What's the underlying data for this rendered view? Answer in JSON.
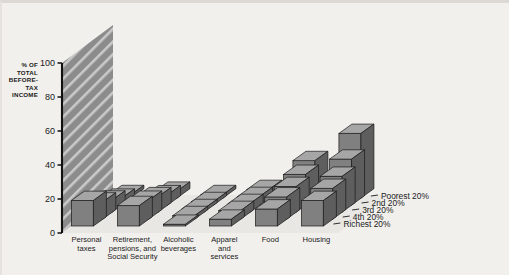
{
  "chart_data": {
    "type": "bar",
    "title": "",
    "subtitle": "",
    "xlabel": "",
    "ylabel": "% OF TOTAL BEFORE-TAX INCOME",
    "ylabel_lines": [
      "% OF",
      "TOTAL",
      "BEFORE-",
      "TAX",
      "INCOME"
    ],
    "ylim": [
      0,
      100
    ],
    "yticks": [
      0,
      20,
      40,
      60,
      80,
      100
    ],
    "ytick_labels": [
      "0",
      "20",
      "40",
      "60",
      "80",
      "100"
    ],
    "grid": false,
    "legend_position": "right-depth-axis",
    "categories": [
      "Personal taxes",
      "Retirement, pensions, and Social Security",
      "Alcoholic beverages",
      "Apparel and services",
      "Food",
      "Housing"
    ],
    "category_label_lines": [
      [
        "Personal",
        "taxes"
      ],
      [
        "Retirement,",
        "pensions, and",
        "Social Security"
      ],
      [
        "Alcoholic",
        "beverages"
      ],
      [
        "Apparel",
        "and",
        "services"
      ],
      [
        "Food"
      ],
      [
        "Housing"
      ]
    ],
    "depth_categories": [
      "Poorest 20%",
      "2nd 20%",
      "3rd 20%",
      "4th 20%",
      "Richest 20%"
    ],
    "series": [
      {
        "name": "Poorest 20%",
        "values": [
          2,
          4,
          2,
          5,
          22,
          38
        ]
      },
      {
        "name": "2nd 20%",
        "values": [
          4,
          6,
          2,
          5,
          18,
          27
        ]
      },
      {
        "name": "3rd 20%",
        "values": [
          7,
          9,
          2,
          5,
          15,
          21
        ]
      },
      {
        "name": "4th 20%",
        "values": [
          10,
          11,
          2,
          5,
          13,
          18
        ]
      },
      {
        "name": "Richest 20%",
        "values": [
          15,
          12,
          1,
          4,
          10,
          15
        ]
      }
    ]
  },
  "style": {
    "background": "#f2f0ed",
    "bar_front": "#808080",
    "bar_top": "#a6a6a6",
    "bar_side": "#5e5e5e",
    "bar_edge": "#1a1a1a",
    "wall": "#8c8c8c",
    "wall_stripe": "#c9c9c9",
    "floor": "#e9e7e3",
    "axis": "#111111",
    "text": "#1a1a1a"
  }
}
